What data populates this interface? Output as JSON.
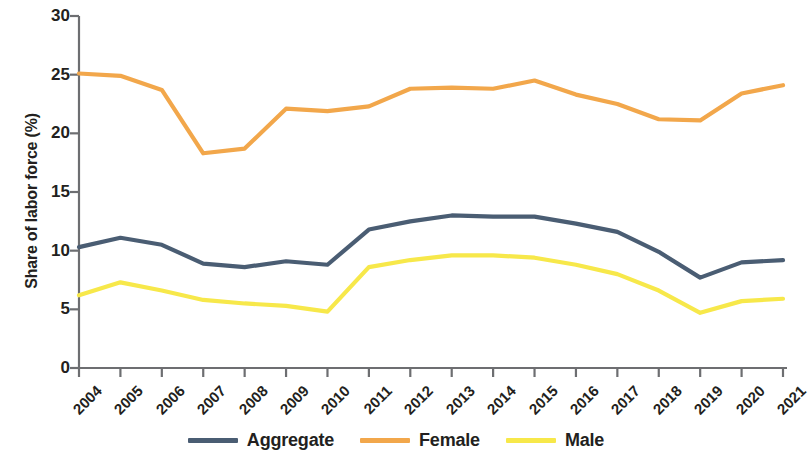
{
  "chart_data": {
    "type": "line",
    "title": "",
    "xlabel": "",
    "ylabel": "Share of labor force (%)",
    "categories": [
      "2004",
      "2005",
      "2006",
      "2007",
      "2008",
      "2009",
      "2010",
      "2011",
      "2012",
      "2013",
      "2014",
      "2015",
      "2016",
      "2017",
      "2018",
      "2019",
      "2020",
      "2021"
    ],
    "x": [
      2004,
      2005,
      2006,
      2007,
      2008,
      2009,
      2010,
      2011,
      2012,
      2013,
      2014,
      2015,
      2016,
      2017,
      2018,
      2019,
      2020,
      2021
    ],
    "xlim": [
      2004,
      2021
    ],
    "ylim": [
      0,
      30
    ],
    "yticks": [
      0,
      5,
      10,
      15,
      20,
      25,
      30
    ],
    "ytick_labels": [
      "0",
      "5",
      "10",
      "15",
      "20",
      "25",
      "30"
    ],
    "grid": false,
    "legend_position": "bottom",
    "series": [
      {
        "name": "Aggregate",
        "color": "#4a5d73",
        "values": [
          10.3,
          11.1,
          10.5,
          8.9,
          8.6,
          9.1,
          8.8,
          11.8,
          12.5,
          13.0,
          12.9,
          12.9,
          12.3,
          11.6,
          9.9,
          7.7,
          9.0,
          9.2
        ]
      },
      {
        "name": "Female",
        "color": "#f2a74b",
        "values": [
          25.1,
          24.9,
          23.7,
          18.3,
          18.7,
          22.1,
          21.9,
          22.3,
          23.8,
          23.9,
          23.8,
          24.5,
          23.3,
          22.5,
          21.2,
          21.1,
          23.4,
          24.1
        ]
      },
      {
        "name": "Male",
        "color": "#f7e84a",
        "values": [
          6.2,
          7.3,
          6.6,
          5.8,
          5.5,
          5.3,
          4.8,
          8.6,
          9.2,
          9.6,
          9.6,
          9.4,
          8.8,
          8.0,
          6.6,
          4.7,
          5.7,
          5.9
        ]
      }
    ]
  },
  "legend": {
    "items": [
      {
        "label": "Aggregate",
        "color": "#4a5d73"
      },
      {
        "label": "Female",
        "color": "#f2a74b"
      },
      {
        "label": "Male",
        "color": "#f7e84a"
      }
    ]
  },
  "axis": {
    "y_title": "Share of labor force (%)",
    "axis_color": "#6d6e71"
  }
}
